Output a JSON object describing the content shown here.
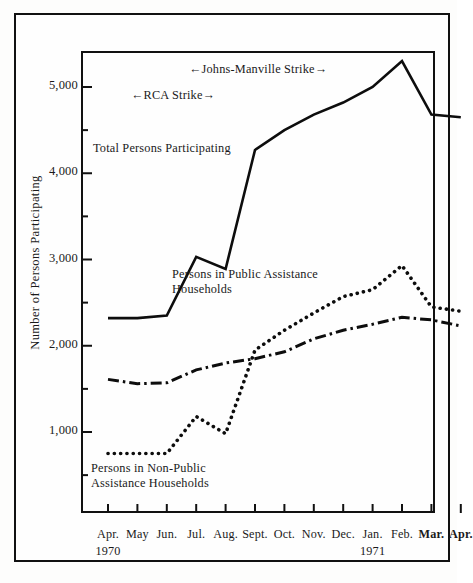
{
  "figure": {
    "y_axis_title": "Number of Persons Participating",
    "annotations": {
      "johns_manville": "←Johns-Manville  Strike→",
      "rca": "←RCA  Strike→"
    },
    "series_labels": {
      "total": "Total Persons Participating",
      "public": "Persons in Public Assistance\nHouseholds",
      "nonpublic": "Persons in Non-Public\nAssistance Households"
    },
    "year_left": "1970",
    "year_right": "1971"
  },
  "chart_data": {
    "type": "line",
    "title": "",
    "xlabel": "",
    "ylabel": "Number of Persons Participating",
    "grid": false,
    "legend": "inline-labels",
    "ylim": [
      0,
      5600
    ],
    "yticks": [
      1000,
      2000,
      3000,
      4000,
      5000
    ],
    "ytick_labels": [
      "1,000",
      "2,000",
      "3,000",
      "4,000",
      "5,000"
    ],
    "yminor_ticks": [
      500,
      1500,
      2500,
      3500,
      4500,
      5500
    ],
    "categories": [
      "Apr.",
      "May",
      "Jun.",
      "Jul.",
      "Aug.",
      "Sept.",
      "Oct.",
      "Nov.",
      "Dec.",
      "Jan.",
      "Feb.",
      "Mar.",
      "Apr."
    ],
    "x_year_groups": [
      {
        "label": "1970",
        "at_category": "Apr."
      },
      {
        "label": "1971",
        "at_category": "Jan."
      }
    ],
    "series": [
      {
        "name": "Total Persons Participating",
        "style": "solid",
        "values": [
          2320,
          2320,
          2350,
          3030,
          2890,
          4270,
          4500,
          4680,
          4820,
          5000,
          5300,
          4680,
          4650
        ]
      },
      {
        "name": "Persons in Public Assistance Households",
        "style": "dash-dot",
        "values": [
          1610,
          1560,
          1570,
          1720,
          1800,
          1850,
          1930,
          2080,
          2180,
          2250,
          2330,
          2300,
          2230
        ]
      },
      {
        "name": "Persons in Non-Public Assistance Households",
        "style": "dotted",
        "values": [
          750,
          750,
          750,
          1180,
          980,
          1950,
          2180,
          2380,
          2570,
          2650,
          2930,
          2450,
          2400
        ]
      }
    ],
    "annotations": [
      {
        "text": "←Johns-Manville  Strike→",
        "span": [
          "Jul.",
          "Jan."
        ],
        "y": 5600
      },
      {
        "text": "←RCA  Strike→",
        "span": [
          "Jun.",
          "Sept."
        ],
        "y": 5050
      }
    ]
  }
}
